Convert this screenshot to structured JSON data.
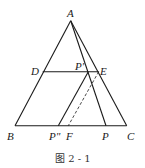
{
  "figure": {
    "caption": "图 2 - 1",
    "points": {
      "A": {
        "label": "A",
        "x": 70.7,
        "y": 20.7
      },
      "B": {
        "label": "B",
        "x": 15,
        "y": 125.7
      },
      "C": {
        "label": "C",
        "x": 126.7,
        "y": 125.7
      },
      "D": {
        "label": "D",
        "x": 42.7,
        "y": 71.7
      },
      "E": {
        "label": "E",
        "x": 98.7,
        "y": 71.7
      },
      "P1": {
        "label": "P'",
        "x": 88.3,
        "y": 71.7
      },
      "P": {
        "label": "P",
        "x": 106,
        "y": 125.7
      },
      "P2": {
        "label": "P\"",
        "x": 58.3,
        "y": 125.7
      },
      "F": {
        "label": "F",
        "x": 68.3,
        "y": 125.7
      }
    },
    "segments": [
      {
        "from": "A",
        "to": "B",
        "style": "solid"
      },
      {
        "from": "A",
        "to": "C",
        "style": "solid"
      },
      {
        "from": "B",
        "to": "C",
        "style": "solid"
      },
      {
        "from": "D",
        "to": "E",
        "style": "solid"
      },
      {
        "from": "A",
        "to": "P",
        "style": "solid"
      },
      {
        "from": "P1",
        "to": "P2",
        "style": "solid"
      },
      {
        "from": "E",
        "to": "F",
        "style": "dashed"
      }
    ]
  }
}
